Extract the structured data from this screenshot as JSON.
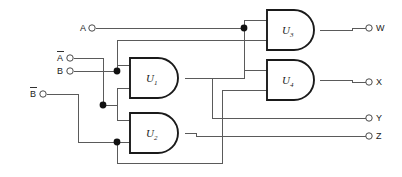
{
  "diagram": {
    "type": "logic-circuit-schematic",
    "background_color": "#ffffff",
    "wire_color": "#5a5a5a",
    "gate_outline_color": "#1a1a1a"
  },
  "inputs": [
    {
      "id": "in-a",
      "label": "A",
      "overbar": false,
      "x": 90,
      "y": 28
    },
    {
      "id": "in-a-bar",
      "label": "A",
      "overbar": true,
      "x": 67,
      "y": 58
    },
    {
      "id": "in-b",
      "label": "B",
      "overbar": false,
      "x": 67,
      "y": 71
    },
    {
      "id": "in-b-bar",
      "label": "B",
      "overbar": true,
      "x": 40,
      "y": 94
    }
  ],
  "outputs": [
    {
      "id": "out-w",
      "label": "W",
      "x": 372,
      "y": 28
    },
    {
      "id": "out-x",
      "label": "X",
      "x": 372,
      "y": 82
    },
    {
      "id": "out-y",
      "label": "Y",
      "x": 372,
      "y": 118
    },
    {
      "id": "out-z",
      "label": "Z",
      "x": 372,
      "y": 136
    }
  ],
  "gates": [
    {
      "id": "u1",
      "label": "U",
      "subscript": "1",
      "kind": "and-gate",
      "x": 130,
      "y": 58,
      "w": 55,
      "h": 40
    },
    {
      "id": "u2",
      "label": "U",
      "subscript": "2",
      "kind": "and-gate",
      "x": 130,
      "y": 113,
      "w": 55,
      "h": 40
    },
    {
      "id": "u3",
      "label": "U",
      "subscript": "3",
      "kind": "and-gate",
      "x": 267,
      "y": 10,
      "w": 53,
      "h": 40
    },
    {
      "id": "u4",
      "label": "U",
      "subscript": "4",
      "kind": "and-gate",
      "x": 267,
      "y": 60,
      "w": 53,
      "h": 40
    }
  ],
  "junctions": [
    {
      "id": "j-b-split",
      "x": 117,
      "y": 71
    },
    {
      "id": "j-abar-split",
      "x": 103,
      "y": 105
    },
    {
      "id": "j-bbar-split",
      "x": 117,
      "y": 142
    },
    {
      "id": "j-a-split",
      "x": 244,
      "y": 28
    }
  ],
  "wire_paths": {
    "a_to_u3": "A input runs right to junction then into U3 top input",
    "abar_to_u2": "A-bar drops down and feeds U2 upper input",
    "b_to_u1": "B feeds U1 upper input via junction",
    "bbar_to_u2": "B-bar feeds U2 lower input via junction",
    "b_branch_up": "B branch rises to U3 second input",
    "u1_to_u4": "U1 output routes to U4 lower input",
    "u2_to_out": "U2 output routes to Z output",
    "u3_to_w": "U3 output to W",
    "u4_to_x": "U4 output to X",
    "u1_to_y": "U1 output branch to Y"
  }
}
